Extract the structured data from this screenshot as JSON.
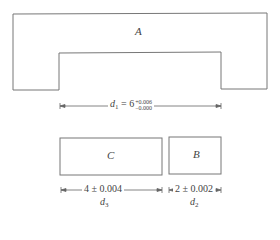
{
  "shapes": {
    "A": {
      "label": "A"
    },
    "B": {
      "label": "B"
    },
    "C": {
      "label": "C"
    }
  },
  "dimensions": {
    "d1": {
      "var": "d",
      "sub": "1",
      "eq": " = 6",
      "tol_plus": "+0.006",
      "tol_minus": "−0.000"
    },
    "d3": {
      "value": "4 ± 0.004",
      "var": "d",
      "sub": "3"
    },
    "d2": {
      "value": "2 ± 0.002",
      "var": "d",
      "sub": "2"
    }
  },
  "colors": {
    "line": "#777777",
    "background": "#ffffff"
  }
}
